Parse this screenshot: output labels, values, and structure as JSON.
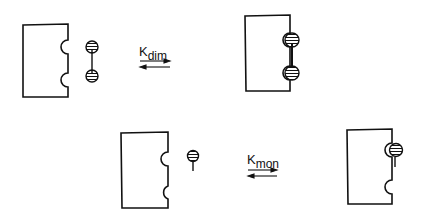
{
  "diagram": {
    "top_reaction": {
      "label_main": "K",
      "label_sub": "dim",
      "description": "Dimeric ligand binding two sites on receptor surface"
    },
    "bottom_reaction": {
      "label_main": "K",
      "label_sub": "mon",
      "description": "Monomeric ligand binding one site on receptor surface"
    },
    "colors": {
      "stroke": "#111111",
      "background": "#ffffff"
    }
  }
}
